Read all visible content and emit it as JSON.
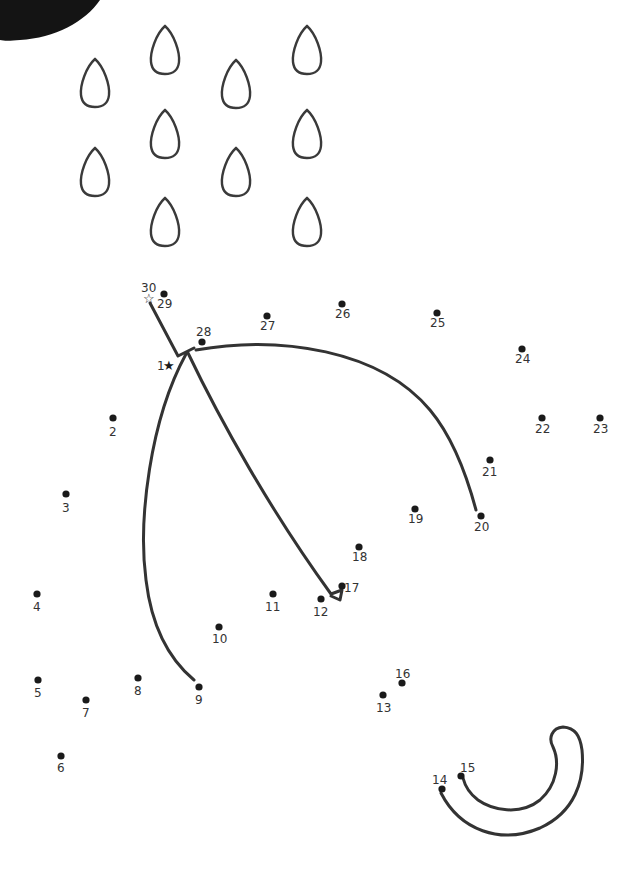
{
  "worksheet": {
    "title": "Connect the dots - Umbrella in the rain",
    "colors": {
      "ink": "#333333",
      "dot": "#1a1a1a",
      "corner_blob": "#141414",
      "background": "#ffffff"
    },
    "start_marker": {
      "label": "1",
      "icon": "filled-star",
      "x": 169,
      "y": 365
    },
    "end_marker": {
      "label": "30",
      "icon": "outline-star",
      "x": 149,
      "y": 298
    },
    "dots": [
      {
        "n": "1",
        "x": 169,
        "y": 365,
        "lx": 157,
        "ly": 370
      },
      {
        "n": "2",
        "x": 113,
        "y": 418,
        "lx": 109,
        "ly": 436
      },
      {
        "n": "3",
        "x": 66,
        "y": 494,
        "lx": 62,
        "ly": 512
      },
      {
        "n": "4",
        "x": 37,
        "y": 594,
        "lx": 33,
        "ly": 611
      },
      {
        "n": "5",
        "x": 38,
        "y": 680,
        "lx": 34,
        "ly": 697
      },
      {
        "n": "6",
        "x": 61,
        "y": 756,
        "lx": 57,
        "ly": 772
      },
      {
        "n": "7",
        "x": 86,
        "y": 700,
        "lx": 82,
        "ly": 717
      },
      {
        "n": "8",
        "x": 138,
        "y": 678,
        "lx": 134,
        "ly": 695
      },
      {
        "n": "9",
        "x": 199,
        "y": 687,
        "lx": 195,
        "ly": 704
      },
      {
        "n": "10",
        "x": 219,
        "y": 627,
        "lx": 212,
        "ly": 643
      },
      {
        "n": "11",
        "x": 273,
        "y": 594,
        "lx": 265,
        "ly": 611
      },
      {
        "n": "12",
        "x": 321,
        "y": 599,
        "lx": 313,
        "ly": 616
      },
      {
        "n": "13",
        "x": 383,
        "y": 695,
        "lx": 376,
        "ly": 712
      },
      {
        "n": "14",
        "x": 442,
        "y": 789,
        "lx": 432,
        "ly": 784
      },
      {
        "n": "15",
        "x": 461,
        "y": 776,
        "lx": 460,
        "ly": 772
      },
      {
        "n": "16",
        "x": 402,
        "y": 683,
        "lx": 395,
        "ly": 678
      },
      {
        "n": "17",
        "x": 342,
        "y": 586,
        "lx": 344,
        "ly": 592
      },
      {
        "n": "18",
        "x": 359,
        "y": 547,
        "lx": 352,
        "ly": 561
      },
      {
        "n": "19",
        "x": 415,
        "y": 509,
        "lx": 408,
        "ly": 523
      },
      {
        "n": "20",
        "x": 481,
        "y": 516,
        "lx": 474,
        "ly": 531
      },
      {
        "n": "21",
        "x": 490,
        "y": 460,
        "lx": 482,
        "ly": 476
      },
      {
        "n": "22",
        "x": 542,
        "y": 418,
        "lx": 535,
        "ly": 433
      },
      {
        "n": "23",
        "x": 600,
        "y": 418,
        "lx": 593,
        "ly": 433
      },
      {
        "n": "24",
        "x": 522,
        "y": 349,
        "lx": 515,
        "ly": 363
      },
      {
        "n": "25",
        "x": 437,
        "y": 313,
        "lx": 430,
        "ly": 327
      },
      {
        "n": "26",
        "x": 342,
        "y": 304,
        "lx": 335,
        "ly": 318
      },
      {
        "n": "27",
        "x": 267,
        "y": 316,
        "lx": 260,
        "ly": 330
      },
      {
        "n": "28",
        "x": 202,
        "y": 342,
        "lx": 196,
        "ly": 336
      },
      {
        "n": "29",
        "x": 164,
        "y": 294,
        "lx": 157,
        "ly": 308
      },
      {
        "n": "30",
        "x": 149,
        "y": 298,
        "lx": 141,
        "ly": 292
      }
    ],
    "raindrops": [
      {
        "x": 165,
        "y": 50
      },
      {
        "x": 307,
        "y": 50
      },
      {
        "x": 95,
        "y": 83
      },
      {
        "x": 236,
        "y": 84
      },
      {
        "x": 165,
        "y": 134
      },
      {
        "x": 307,
        "y": 134
      },
      {
        "x": 95,
        "y": 172
      },
      {
        "x": 236,
        "y": 172
      },
      {
        "x": 165,
        "y": 222
      },
      {
        "x": 307,
        "y": 222
      }
    ]
  }
}
